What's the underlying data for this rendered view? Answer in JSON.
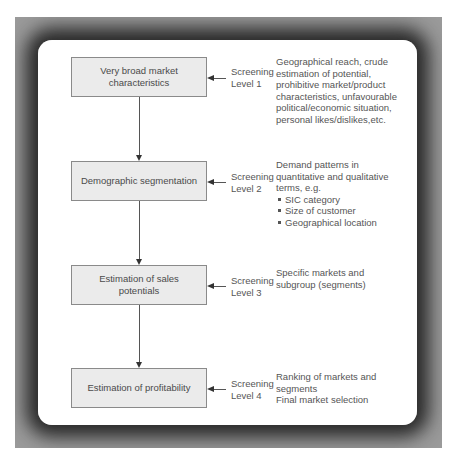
{
  "diagram": {
    "stages": [
      {
        "box_label": "Very broad market characteristics",
        "screening": "Screening",
        "level": "Level 1",
        "description_lines": [
          "Geographical reach, crude",
          "estimation of potential,",
          "prohibitive market/product",
          "characteristics, unfavourable",
          "political/economic situation,",
          "personal likes/dislikes,etc."
        ]
      },
      {
        "box_label": "Demographic segmentation",
        "screening": "Screening",
        "level": "Level 2",
        "description_lines": [
          "Demand patterns in",
          "quantitative and qualitative",
          "terms, e.g."
        ],
        "bullets": [
          "SIC category",
          "Size of customer",
          "Geographical location"
        ]
      },
      {
        "box_label": "Estimation of sales potentials",
        "screening": "Screening",
        "level": "Level 3",
        "description_lines": [
          "Specific markets and",
          "subgroup (segments)"
        ]
      },
      {
        "box_label": "Estimation of profitability",
        "screening": "Screening",
        "level": "Level 4",
        "description_lines": [
          "Ranking of markets and",
          "segments",
          "Final market selection"
        ]
      }
    ],
    "colors": {
      "box_fill": "#ebebeb",
      "box_border": "#8a8a8a",
      "text": "#4a4a4a",
      "frame": "#9a9a9a",
      "panel": "#ffffff"
    }
  }
}
